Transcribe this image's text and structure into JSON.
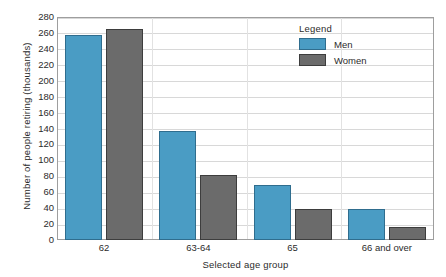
{
  "chart_data": {
    "type": "bar",
    "title": "",
    "xlabel": "Selected age group",
    "ylabel": "Number of people retiring  (thousands)",
    "categories": [
      "62",
      "63-64",
      "65",
      "66 and over"
    ],
    "series": [
      {
        "name": "Men",
        "color": "#4a9cc4",
        "values": [
          258,
          137,
          69,
          39
        ]
      },
      {
        "name": "Women",
        "color": "#6b6b6b",
        "values": [
          265,
          82,
          39,
          16
        ]
      }
    ],
    "ylim": [
      0,
      280
    ],
    "ytick_step": 20,
    "yticks": [
      280,
      260,
      240,
      220,
      200,
      180,
      160,
      140,
      120,
      100,
      80,
      60,
      40,
      20,
      0
    ],
    "grid": true,
    "grid_axis": "y",
    "legend": {
      "title": "Legend",
      "position": "inside-top-right",
      "entries": [
        "Men",
        "Women"
      ]
    }
  }
}
